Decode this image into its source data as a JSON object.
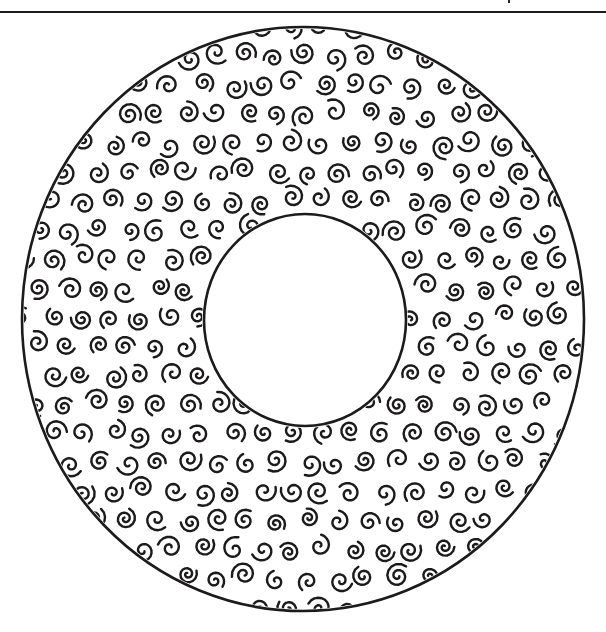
{
  "figure": {
    "width": 606,
    "height": 632,
    "background": "#ffffff",
    "ink_color": "#1c1a1a"
  },
  "top_rule": {
    "y": 12,
    "thickness": 2
  },
  "outer_ring": {
    "cx": 303,
    "cy": 319,
    "rx": 281,
    "ry": 292,
    "stroke_width": 2.6
  },
  "inner_hole": {
    "cx": 305,
    "cy": 320,
    "rx": 101,
    "ry": 106,
    "stroke_width": 2.6
  },
  "swirl_pattern": {
    "motif": "spiral-icon",
    "spacing_x": 30,
    "spacing_y": 29,
    "row_offset": 15,
    "size": 11,
    "stroke_width": 2.4,
    "jitter": 4,
    "seed": 17
  }
}
